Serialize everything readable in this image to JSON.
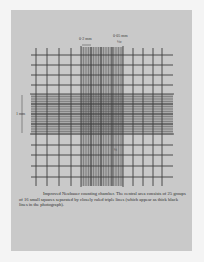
{
  "document": {
    "type": "photograph of printed page",
    "figure": "Improved Neubauer counting chamber grid",
    "labels": {
      "top_left": "0·2 mm",
      "top_right": "0·05 mm",
      "top_right_sub": "¼c",
      "left": "1 mm",
      "inner_mark": "¼"
    },
    "caption": {
      "title": "Improved Neubauer counting chamber.",
      "body": "The central area consists of 25 groups of 16 small squares separated by closely ruled triple lines (which appear as thick black lines in the photograph)."
    },
    "colors": {
      "background": "#f4f4f4",
      "paper": "#c9c9c9",
      "grid_line": "#3c3c3c",
      "dense_band": "#9a9a9a",
      "text": "#2f2f2f"
    }
  }
}
